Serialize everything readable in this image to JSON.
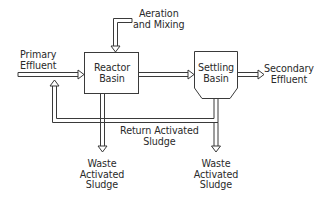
{
  "diagram": {
    "colors": {
      "stroke": "#3a3a3a",
      "text": "#2a2a2a",
      "background": "#ffffff"
    },
    "nodes": [
      {
        "id": "reactor",
        "label_lines": [
          "Reactor",
          "Basin"
        ],
        "shape": "rectangle"
      },
      {
        "id": "settling",
        "label_lines": [
          "Settling",
          "Basin"
        ],
        "shape": "hopper"
      }
    ],
    "labels": {
      "primary_effluent": [
        "Primary",
        "Effluent"
      ],
      "aeration": [
        "Aeration",
        "and Mixing"
      ],
      "secondary_effluent": [
        "Secondary",
        "Effluent"
      ],
      "return_sludge": [
        "Return Activated",
        "Sludge"
      ],
      "waste_sludge_1": [
        "Waste",
        "Activated",
        "Sludge"
      ],
      "waste_sludge_2": [
        "Waste",
        "Activated",
        "Sludge"
      ]
    },
    "edges": [
      {
        "from": "Primary Effluent",
        "to": "reactor"
      },
      {
        "from": "Aeration and Mixing",
        "to": "reactor"
      },
      {
        "from": "reactor",
        "to": "settling"
      },
      {
        "from": "settling",
        "to": "Secondary Effluent"
      },
      {
        "from": "settling",
        "to": "reactor",
        "label": "Return Activated Sludge"
      },
      {
        "from": "reactor",
        "to": "Waste Activated Sludge"
      },
      {
        "from": "settling",
        "to": "Waste Activated Sludge"
      }
    ]
  }
}
